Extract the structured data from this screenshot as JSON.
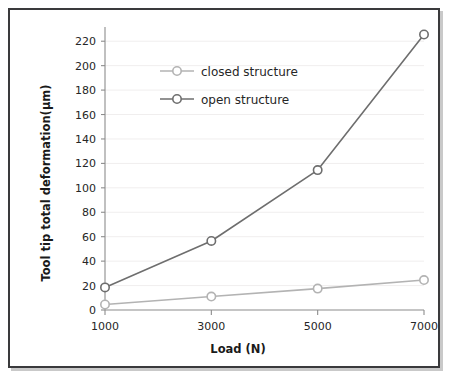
{
  "figure": {
    "frame_color": "#3a3a3c",
    "background": "#ffffff"
  },
  "chart_data": {
    "type": "line",
    "title": "",
    "xlabel": "Load (N)",
    "ylabel": "Tool tip total deformation(μm)",
    "categories": [
      "1000",
      "3000",
      "5000",
      "7000"
    ],
    "x": [
      1000,
      3000,
      5000,
      7000
    ],
    "xlim": [
      1000,
      7000
    ],
    "ylim": [
      0,
      230
    ],
    "yticks": [
      0,
      20,
      40,
      60,
      80,
      100,
      120,
      140,
      160,
      180,
      200,
      220
    ],
    "ytick_labels": [
      "0",
      "20",
      "40",
      "60",
      "80",
      "100",
      "120",
      "140",
      "160",
      "180",
      "200",
      "220"
    ],
    "xticks": [
      1000,
      3000,
      5000,
      7000
    ],
    "xtick_labels": [
      "1000",
      "3000",
      "5000",
      "7000"
    ],
    "grid": true,
    "grid_color": "#f0eeee",
    "legend_position": "upper-center-left",
    "marker": "circle-open",
    "series": [
      {
        "name": "closed structure",
        "color": "#b3b3b3",
        "values": [
          4.5,
          11,
          17.5,
          24.5
        ]
      },
      {
        "name": "open structure",
        "color": "#6e6e6e",
        "values": [
          18.5,
          56.5,
          114.5,
          225.5
        ]
      }
    ]
  },
  "legend": {
    "items": [
      {
        "label": "closed structure",
        "color": "#b3b3b3"
      },
      {
        "label": "open structure",
        "color": "#6e6e6e"
      }
    ]
  },
  "axes": {
    "axis_line_color": "#8c8c8c",
    "tick_color": "#8c8c8c",
    "tick_text_color": "#262626"
  }
}
